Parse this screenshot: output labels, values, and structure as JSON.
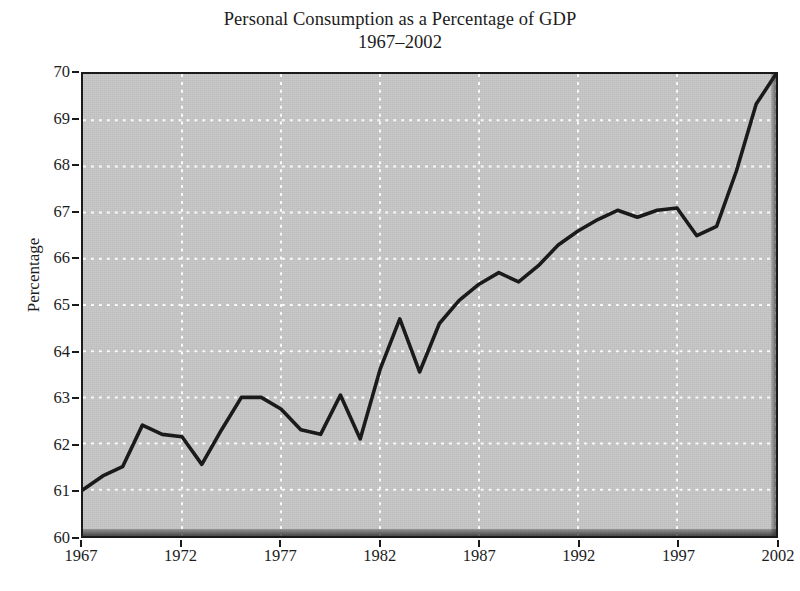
{
  "chart_data": {
    "type": "line",
    "title": "Personal Consumption as a Percentage of GDP",
    "subtitle": "1967–2002",
    "xlabel": "",
    "ylabel": "Percentage",
    "xlim": [
      1967,
      2002
    ],
    "ylim": [
      60,
      70
    ],
    "grid": true,
    "grid_style": "dotted-white",
    "legend": "none",
    "background_color": "#c6c6c6",
    "line_color": "#1a1a1a",
    "xticks": [
      1967,
      1972,
      1977,
      1982,
      1987,
      1992,
      1997,
      2002
    ],
    "yticks": [
      60,
      61,
      62,
      63,
      64,
      65,
      66,
      67,
      68,
      69,
      70
    ],
    "x": [
      1967,
      1968,
      1969,
      1970,
      1971,
      1972,
      1973,
      1974,
      1975,
      1976,
      1977,
      1978,
      1979,
      1980,
      1981,
      1982,
      1983,
      1984,
      1985,
      1986,
      1987,
      1988,
      1989,
      1990,
      1991,
      1992,
      1993,
      1994,
      1995,
      1996,
      1997,
      1998,
      1999,
      2000,
      2001,
      2002
    ],
    "series": [
      {
        "name": "Personal Consumption as a Percentage of GDP",
        "values": [
          61.0,
          61.3,
          61.5,
          62.4,
          62.2,
          62.15,
          61.55,
          62.3,
          63.0,
          63.0,
          62.75,
          62.3,
          62.2,
          63.05,
          62.1,
          63.6,
          64.7,
          63.55,
          64.6,
          65.1,
          65.45,
          65.7,
          65.5,
          65.85,
          66.3,
          66.6,
          66.85,
          67.05,
          66.9,
          67.05,
          67.1,
          66.5,
          66.7,
          67.9,
          69.35,
          70.0
        ]
      }
    ]
  },
  "axes": {
    "ytick_labels": [
      "70",
      "69",
      "68",
      "67",
      "66",
      "65",
      "64",
      "63",
      "62",
      "61",
      "60"
    ],
    "xtick_labels": [
      "1967",
      "1972",
      "1977",
      "1982",
      "1987",
      "1992",
      "1997",
      "2002"
    ],
    "ylabel_text": "Percentage"
  },
  "title": {
    "line1": "Personal Consumption as a Percentage of GDP",
    "line2": "1967–2002"
  }
}
